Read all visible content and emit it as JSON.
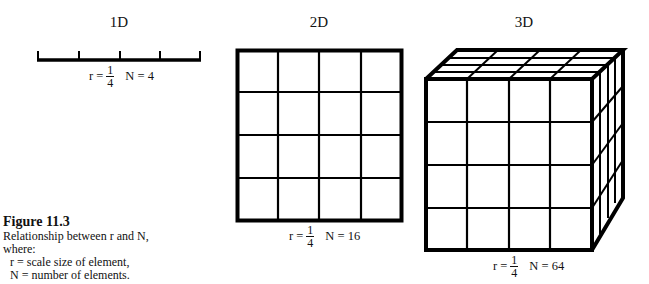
{
  "figure": {
    "panels": [
      {
        "title": "1D",
        "r_prefix": "r =",
        "r_numerator": "1",
        "r_denominator": "4",
        "n_label": "N = 4",
        "segments": 4
      },
      {
        "title": "2D",
        "r_prefix": "r =",
        "r_numerator": "1",
        "r_denominator": "4",
        "n_label": "N = 16",
        "grid": [
          4,
          4
        ]
      },
      {
        "title": "3D",
        "r_prefix": "r =",
        "r_numerator": "1",
        "r_denominator": "4",
        "n_label": "N = 64",
        "cube": [
          4,
          4,
          4
        ]
      }
    ],
    "caption": {
      "heading": "Figure 11.3",
      "line1": "Relationship between r and N,",
      "line2": "where:",
      "line3": "r = scale size of element,",
      "line4": "N = number of elements."
    },
    "colors": {
      "line": "#000000",
      "background": "#ffffff"
    }
  }
}
